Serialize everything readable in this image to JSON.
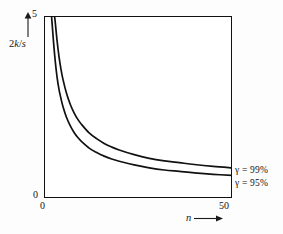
{
  "chart_data": {
    "type": "line",
    "title": "",
    "subtitle": "",
    "xlabel": "n",
    "ylabel": "2k/s",
    "xlim": [
      0,
      50
    ],
    "ylim": [
      0,
      5
    ],
    "xticks": [
      0,
      50
    ],
    "yticks": [
      0,
      5
    ],
    "xtick_labels": [
      "0",
      "50"
    ],
    "ytick_labels": [
      "0",
      "5"
    ],
    "grid": true,
    "grid_x_values": [
      10,
      20,
      30,
      40
    ],
    "grid_y_values": [
      1,
      2,
      3,
      4
    ],
    "legend_position": "right-outside",
    "series": [
      {
        "name": "gamma = 99%",
        "legend_label": "γ = 99%",
        "x": [
          2.8,
          3,
          3.5,
          4,
          4.5,
          5,
          6,
          7,
          8,
          9,
          10,
          12,
          14,
          16,
          18,
          20,
          24,
          28,
          32,
          36,
          40,
          45,
          50
        ],
        "y": [
          5.0,
          4.82,
          4.3,
          3.88,
          3.55,
          3.28,
          2.87,
          2.57,
          2.34,
          2.16,
          2.02,
          1.79,
          1.63,
          1.5,
          1.4,
          1.32,
          1.19,
          1.09,
          1.02,
          0.97,
          0.92,
          0.87,
          0.83
        ]
      },
      {
        "name": "gamma = 95%",
        "legend_label": "γ = 95%",
        "x": [
          2.0,
          2.3,
          2.6,
          3,
          3.5,
          4,
          4.5,
          5,
          6,
          7,
          8,
          9,
          10,
          12,
          14,
          16,
          18,
          20,
          24,
          28,
          32,
          36,
          40,
          45,
          50
        ],
        "y": [
          5.0,
          4.6,
          4.2,
          3.75,
          3.3,
          2.98,
          2.74,
          2.53,
          2.21,
          1.98,
          1.8,
          1.66,
          1.55,
          1.37,
          1.25,
          1.15,
          1.07,
          1.01,
          0.91,
          0.83,
          0.77,
          0.73,
          0.69,
          0.65,
          0.62
        ]
      }
    ],
    "annotations": [
      {
        "text": "γ = 99%",
        "target": "upper-curve-end"
      },
      {
        "text": "γ = 95%",
        "target": "lower-curve-end"
      }
    ],
    "colors": {
      "curve": "#111111",
      "grid": "#8a8a8a",
      "frame": "#111111",
      "background": "#ffffff"
    }
  },
  "axes": {
    "y_label_prefix": "2",
    "y_label_k": "k",
    "y_label_slash": "/",
    "y_label_s": "s",
    "y_max_tick": "5",
    "y_min_tick": "0",
    "x_min_tick": "0",
    "x_max_tick": "50",
    "x_label_symbol": "n"
  },
  "legend": {
    "upper": "γ = 99%",
    "lower": "γ = 95%"
  },
  "icons": {
    "y_axis_arrow": "arrow-up-icon",
    "x_axis_arrow": "arrow-right-icon"
  }
}
